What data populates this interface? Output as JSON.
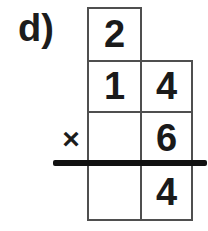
{
  "problem": {
    "label": "d)",
    "operator": "×",
    "grid": {
      "carry": {
        "tens": "2"
      },
      "multiplicand": {
        "tens": "1",
        "ones": "4"
      },
      "multiplier": {
        "tens": "",
        "ones": "6"
      },
      "product": {
        "tens": "",
        "ones": "4"
      }
    }
  },
  "colors": {
    "background": "#ffffff",
    "digit": "#1a1a1a",
    "grid_line": "#4f4f4f",
    "answer_bar": "#111111"
  }
}
